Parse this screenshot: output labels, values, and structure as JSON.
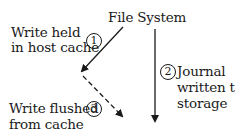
{
  "diagram": {
    "title": "File System",
    "steps": [
      {
        "number": "1",
        "label_line1": "Write held",
        "label_line2": "in host cache",
        "arrow_style": "solid"
      },
      {
        "number": "2",
        "label_line1": "Journal",
        "label_line2": "written to",
        "label_line3": "storage",
        "arrow_style": "solid"
      },
      {
        "number": "3",
        "label_line1": "Write flushed",
        "label_line2": "from cache",
        "arrow_style": "dashed"
      }
    ],
    "colors": {
      "stroke": "#1a1a1a",
      "background": "#ffffff"
    }
  }
}
